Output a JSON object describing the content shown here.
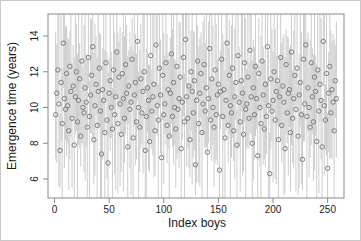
{
  "chart_data": {
    "type": "scatter",
    "title": "",
    "xlabel": "Index boys",
    "ylabel": "Emergence time (years)",
    "x_ticks": [
      0,
      50,
      100,
      150,
      200,
      250
    ],
    "y_ticks": [
      6,
      8,
      10,
      12,
      14
    ],
    "xlim": [
      -6,
      265
    ],
    "ylim": [
      4.94,
      15.23
    ],
    "grid": false,
    "legend": "none",
    "marker": "open-circle",
    "n_points": 258,
    "x_start": 1,
    "x_step": 1,
    "colors": {
      "interval": "#c7c7c7",
      "point": "#737373",
      "axis": "#8a8a8a",
      "text": "#1a1a1a",
      "background": "#ffffff",
      "frame": "#c9c9c9"
    },
    "series": [
      {
        "name": "emergence time estimate",
        "role": "point",
        "values": [
          9.6,
          10.8,
          12.1,
          10.2,
          7.6,
          11.4,
          9.1,
          13.6,
          10.5,
          9.9,
          11.9,
          10.1,
          8.7,
          12.3,
          10.9,
          9.4,
          11.2,
          7.9,
          10.6,
          12.0,
          9.2,
          10.4,
          11.6,
          8.4,
          12.6,
          10.0,
          9.7,
          11.1,
          10.3,
          8.9,
          12.8,
          9.5,
          10.7,
          11.8,
          13.4,
          8.2,
          10.1,
          11.3,
          9.0,
          10.9,
          12.2,
          9.8,
          7.4,
          11.0,
          10.4,
          8.6,
          12.5,
          9.3,
          6.9,
          10.8,
          11.5,
          10.0,
          8.8,
          12.1,
          9.6,
          10.6,
          13.1,
          9.1,
          11.7,
          10.2,
          8.5,
          11.9,
          10.5,
          9.4,
          12.4,
          10.8,
          7.8,
          11.2,
          9.9,
          10.3,
          12.7,
          8.3,
          10.7,
          11.4,
          9.2,
          13.7,
          10.0,
          8.9,
          11.6,
          9.7,
          10.9,
          12.0,
          7.6,
          9.5,
          11.1,
          10.4,
          8.1,
          12.9,
          9.8,
          10.6,
          11.3,
          8.7,
          13.5,
          10.1,
          9.3,
          12.2,
          10.7,
          7.2,
          11.8,
          9.6,
          10.2,
          12.5,
          9.0,
          11.0,
          8.4,
          10.8,
          13.0,
          9.5,
          11.4,
          10.0,
          8.8,
          12.3,
          9.9,
          10.5,
          11.7,
          7.7,
          10.3,
          12.8,
          9.2,
          13.8,
          10.6,
          9.4,
          11.2,
          8.2,
          12.0,
          10.9,
          9.7,
          11.5,
          6.8,
          10.4,
          12.6,
          9.1,
          10.8,
          11.9,
          8.6,
          10.2,
          12.4,
          9.8,
          11.1,
          7.5,
          10.5,
          13.3,
          9.3,
          11.6,
          10.0,
          8.9,
          12.1,
          9.6,
          10.7,
          11.3,
          6.5,
          10.9,
          12.7,
          9.5,
          11.0,
          8.3,
          10.4,
          13.6,
          9.0,
          11.8,
          10.1,
          9.7,
          12.2,
          8.7,
          10.6,
          11.4,
          7.9,
          12.9,
          10.3,
          9.2,
          11.5,
          10.8,
          8.5,
          12.5,
          9.9,
          10.2,
          11.7,
          9.4,
          13.2,
          10.6,
          8.0,
          11.1,
          9.6,
          12.3,
          10.5,
          7.3,
          11.9,
          10.0,
          9.1,
          12.6,
          10.7,
          8.8,
          11.3,
          9.5,
          13.4,
          10.1,
          6.3,
          11.6,
          9.8,
          10.4,
          12.0,
          9.3,
          10.9,
          11.5,
          8.2,
          10.6,
          12.8,
          9.0,
          11.2,
          10.3,
          7.7,
          12.4,
          9.7,
          10.8,
          11.0,
          8.6,
          13.1,
          9.4,
          10.5,
          11.8,
          9.9,
          12.2,
          8.4,
          10.7,
          11.4,
          9.6,
          7.1,
          12.7,
          10.2,
          13.5,
          9.5,
          11.1,
          10.0,
          8.9,
          12.5,
          10.6,
          9.2,
          11.7,
          10.9,
          8.1,
          12.1,
          9.8,
          11.3,
          10.4,
          7.8,
          13.7,
          10.1,
          9.3,
          11.9,
          6.6,
          10.8,
          12.3,
          9.7,
          11.0,
          10.3,
          8.7,
          11.5,
          10.5
        ]
      },
      {
        "name": "interval lower bound",
        "role": "interval-lower",
        "values": [
          7.1,
          6.9,
          10.4,
          5.6,
          5.5,
          8.1,
          4.9,
          11.1,
          6.6,
          8.2,
          7.3,
          8.0,
          5.4,
          7.1,
          8.4,
          5.5,
          9.5,
          4.9,
          8.5,
          8.7,
          4.9,
          7.9,
          7.7,
          6.7,
          8.0,
          7.9,
          6.4,
          5.9,
          7.8,
          5.0,
          11.1,
          4.9,
          8.6,
          8.5,
          8.2,
          5.7,
          6.2,
          9.6,
          4.9,
          8.8,
          8.9,
          4.9,
          4.9,
          7.1,
          8.7,
          4.9,
          10.4,
          6.0,
          4.9,
          8.3,
          7.6,
          8.3,
          4.9,
          10.0,
          6.3,
          5.4,
          10.6,
          5.2,
          10.0,
          5.6,
          6.4,
          8.6,
          5.3,
          6.9,
          8.5,
          9.1,
          4.9,
          9.1,
          6.6,
          5.1,
          10.2,
          4.9,
          9.0,
          6.8,
          7.1,
          10.4,
          4.9,
          6.4,
          7.7,
          8.0,
          6.3,
          9.9,
          4.9,
          4.9,
          8.6,
          6.5,
          6.4,
          8.3,
          7.7,
          7.3,
          6.1,
          6.2,
          9.6,
          8.4,
          4.9,
          10.1,
          7.4,
          4.9,
          9.3,
          5.7,
          8.5,
          7.9,
          6.9,
          7.7,
          4.9,
          8.3,
          9.1,
          7.8,
          6.8,
          7.9,
          5.5,
          7.1,
          7.4,
          6.6,
          10.0,
          4.9,
          8.2,
          9.5,
          4.9,
          11.3,
          6.7,
          7.7,
          6.6,
          6.1,
          8.7,
          5.7,
          7.2,
          7.6,
          5.1,
          5.8,
          10.5,
          5.8,
          5.6,
          9.4,
          4.9,
          8.5,
          7.8,
          7.7,
          7.8,
          4.9,
          8.0,
          9.4,
          7.6,
          7.0,
          7.9,
          5.6,
          6.9,
          7.1,
          6.8,
          9.6,
          4.9,
          8.8,
          9.4,
          4.9,
          8.5,
          4.9,
          8.7,
          9.0,
          6.9,
          8.5,
          4.9,
          7.2,
          8.3,
          7.0,
          6.0,
          9.3,
          4.9,
          7.7,
          7.8,
          5.3,
          9.8,
          6.2,
          6.4,
          9.2,
          4.9,
          7.7,
          7.8,
          7.7,
          8.6,
          8.5,
          4.9,
          5.9,
          7.1,
          8.4,
          8.8,
          4.9,
          9.8,
          6.7,
          4.9,
          10.1,
          6.8,
          7.1,
          6.7,
          7.4,
          10.1,
          4.9,
          4.9,
          7.7,
          8.1,
          5.8,
          9.9,
          6.0,
          5.7,
          9.0,
          4.9,
          8.9,
          8.2,
          6.9,
          7.9,
          5.1,
          5.2,
          8.5,
          8.0,
          6.2,
          8.9,
          5.3,
          7.9,
          6.9,
          6.6,
          10.1,
          5.3,
          10.1,
          5.1,
          5.5,
          8.9,
          5.7,
          5.4,
          8.1,
          8.1,
          10.2,
          4.9,
          8.6,
          6.1,
          7.2,
          7.9,
          8.5,
          5.9,
          6.5,
          8.4,
          4.9,
          10.4,
          5.2,
          9.2,
          7.1,
          4.9,
          11.2,
          6.2,
          7.6,
          7.3,
          4.9,
          7.5,
          7.1,
          7.2,
          7.1,
          8.6,
          4.9,
          9.4,
          7.2
        ]
      },
      {
        "name": "interval upper bound",
        "role": "interval-upper",
        "values": [
          14.2,
          13.5,
          15.3,
          15.3,
          9.6,
          15.3,
          12.2,
          15.3,
          15.3,
          14.5,
          14.6,
          13.9,
          13.8,
          14.3,
          15.2,
          12.5,
          13.5,
          12.8,
          15.2,
          14.7,
          13.0,
          15.3,
          13.6,
          12.7,
          15.3,
          12.3,
          14.6,
          15.3,
          13.0,
          12.7,
          15.3,
          11.5,
          15.0,
          14.9,
          15.3,
          13.1,
          14.7,
          14.0,
          12.8,
          15.3,
          14.2,
          14.1,
          10.5,
          13.3,
          15.3,
          13.2,
          15.2,
          13.1,
          12.0,
          12.8,
          15.3,
          13.1,
          11.1,
          15.3,
          14.2,
          13.3,
          15.3,
          14.2,
          13.7,
          14.5,
          11.6,
          14.2,
          15.3,
          14.0,
          15.1,
          14.6,
          12.9,
          13.2,
          14.2,
          13.4,
          15.0,
          13.2,
          15.3,
          14.1,
          13.0,
          15.3,
          12.0,
          13.2,
          14.7,
          12.0,
          15.3,
          15.3,
          10.3,
          13.3,
          15.3,
          12.4,
          12.4,
          15.3,
          12.1,
          15.3,
          15.3,
          11.4,
          15.3,
          15.2,
          11.3,
          15.3,
          13.8,
          9.5,
          15.3,
          14.2,
          12.9,
          15.3,
          14.1,
          13.0,
          12.7,
          13.9,
          15.3,
          14.4,
          15.3,
          12.7,
          12.6,
          15.3,
          11.9,
          14.8,
          14.8,
          10.0,
          15.2,
          15.3,
          11.9,
          15.3,
          15.3,
          11.4,
          15.3,
          11.3,
          14.3,
          15.3,
          14.3,
          14.2,
          10.6,
          15.3,
          14.6,
          13.4,
          13.9,
          14.2,
          13.5,
          14.8,
          15.1,
          13.6,
          15.3,
          9.5,
          14.8,
          15.3,
          11.6,
          15.3,
          14.6,
          11.6,
          15.3,
          14.7,
          12.7,
          15.3,
          9.6,
          13.2,
          15.3,
          14.1,
          13.7,
          12.1,
          15.3,
          15.3,
          13.3,
          14.9,
          12.4,
          14.6,
          15.3,
          11.4,
          14.4,
          15.3,
          9.9,
          15.3,
          13.4,
          11.5,
          15.3,
          15.3,
          11.2,
          15.3,
          15.0,
          12.2,
          15.3,
          12.5,
          15.3,
          15.3,
          12.6,
          13.8,
          13.4,
          15.3,
          12.5,
          11.6,
          15.0,
          12.3,
          14.0,
          15.3,
          13.4,
          12.6,
          15.3,
          11.5,
          15.3,
          13.2,
          8.6,
          15.3,
          14.4,
          13.1,
          15.3,
          14.4,
          12.9,
          15.3,
          11.3,
          12.9,
          15.3,
          13.6,
          13.9,
          14.1,
          12.8,
          14.4,
          14.0,
          13.9,
          13.3,
          13.5,
          15.3,
          12.1,
          14.3,
          15.3,
          11.9,
          15.3,
          11.5,
          13.0,
          15.3,
          14.2,
          9.8,
          15.3,
          15.3,
          15.3,
          13.8,
          14.2,
          12.3,
          13.8,
          15.3,
          13.3,
          13.0,
          15.3,
          12.9,
          12.4,
          15.2,
          12.1,
          15.3,
          15.0,
          10.5,
          15.3,
          15.2,
          11.3,
          15.3,
          9.7,
          13.1,
          15.3,
          14.3,
          13.7,
          14.1,
          13.8,
          13.5,
          14.8
        ]
      }
    ]
  }
}
